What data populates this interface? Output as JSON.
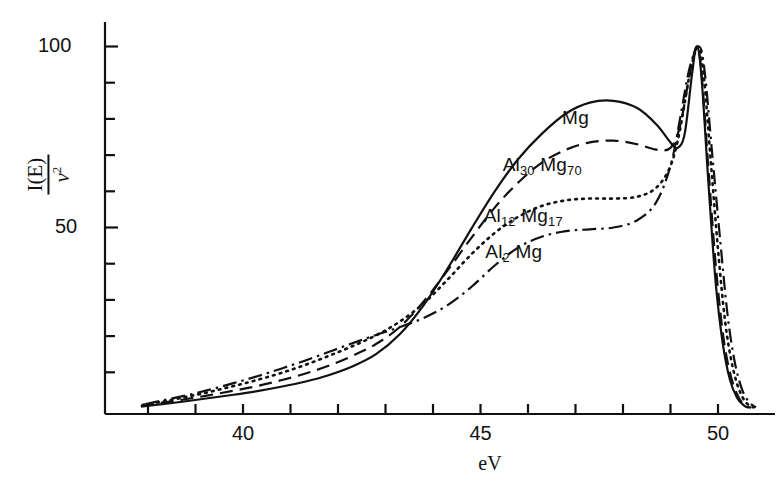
{
  "chart_data": {
    "type": "line",
    "title": "",
    "xlabel": "eV",
    "ylabel": "I(E) / ν²",
    "ylabel_numerator": "I(E)",
    "ylabel_denominator": "ν",
    "ylabel_denominator_exponent": "2",
    "xlim": [
      37.5,
      50.9
    ],
    "ylim": [
      0,
      105
    ],
    "xticks": [
      38,
      39,
      40,
      41,
      42,
      43,
      44,
      45,
      46,
      47,
      48,
      49,
      50
    ],
    "xtick_labels": [
      {
        "value": 40,
        "text": "40"
      },
      {
        "value": 45,
        "text": "45"
      },
      {
        "value": 50,
        "text": "50"
      }
    ],
    "yticks": [
      10,
      20,
      30,
      40,
      50,
      60,
      70,
      80,
      90,
      100
    ],
    "ytick_labels": [
      {
        "value": 50,
        "text": "50"
      },
      {
        "value": 100,
        "text": "100"
      }
    ],
    "grid": false,
    "legend": "inline-annotations",
    "series": [
      {
        "name": "Mg",
        "label": "Mg",
        "linestyle": "solid",
        "label_x": 47.0,
        "label_y": 80.0,
        "points": [
          [
            37.85,
            0.5
          ],
          [
            38.3,
            1.2
          ],
          [
            38.8,
            2.0
          ],
          [
            39.3,
            2.9
          ],
          [
            39.8,
            3.8
          ],
          [
            40.3,
            4.8
          ],
          [
            40.8,
            6.0
          ],
          [
            41.3,
            7.4
          ],
          [
            41.8,
            9.2
          ],
          [
            42.3,
            11.6
          ],
          [
            42.8,
            15.0
          ],
          [
            43.3,
            20.5
          ],
          [
            43.8,
            28.5
          ],
          [
            44.3,
            38.5
          ],
          [
            44.8,
            49.5
          ],
          [
            45.3,
            60.0
          ],
          [
            45.8,
            69.0
          ],
          [
            46.3,
            76.0
          ],
          [
            46.8,
            81.5
          ],
          [
            47.3,
            84.5
          ],
          [
            47.8,
            85.0
          ],
          [
            48.3,
            83.0
          ],
          [
            48.7,
            78.5
          ],
          [
            49.0,
            73.5
          ],
          [
            49.15,
            72.0
          ],
          [
            49.3,
            76.0
          ],
          [
            49.45,
            92.0
          ],
          [
            49.55,
            100.0
          ],
          [
            49.65,
            92.0
          ],
          [
            49.8,
            62.0
          ],
          [
            49.95,
            35.0
          ],
          [
            50.1,
            18.0
          ],
          [
            50.25,
            8.0
          ],
          [
            50.4,
            3.0
          ],
          [
            50.55,
            0.8
          ],
          [
            50.65,
            0.2
          ]
        ]
      },
      {
        "name": "Al30Mg70",
        "label": "Al₃₀ Mg₇₀",
        "label_prefix": "Al",
        "label_sub1": "30",
        "label_mid": " Mg",
        "label_sub2": "70",
        "linestyle": "dashed",
        "label_x": 46.3,
        "label_y": 67.0,
        "points": [
          [
            37.85,
            0.8
          ],
          [
            38.3,
            1.6
          ],
          [
            38.8,
            2.6
          ],
          [
            39.3,
            3.7
          ],
          [
            39.8,
            4.9
          ],
          [
            40.3,
            6.2
          ],
          [
            40.8,
            7.8
          ],
          [
            41.3,
            9.6
          ],
          [
            41.8,
            11.8
          ],
          [
            42.3,
            14.5
          ],
          [
            42.8,
            17.8
          ],
          [
            43.3,
            22.5
          ],
          [
            43.8,
            29.5
          ],
          [
            44.3,
            38.0
          ],
          [
            44.8,
            47.0
          ],
          [
            45.3,
            55.5
          ],
          [
            45.8,
            62.5
          ],
          [
            46.3,
            68.0
          ],
          [
            46.8,
            71.5
          ],
          [
            47.3,
            73.5
          ],
          [
            47.8,
            74.0
          ],
          [
            48.3,
            73.0
          ],
          [
            48.7,
            71.5
          ],
          [
            49.0,
            72.0
          ],
          [
            49.2,
            78.0
          ],
          [
            49.4,
            92.0
          ],
          [
            49.55,
            100.0
          ],
          [
            49.65,
            93.0
          ],
          [
            49.8,
            66.0
          ],
          [
            49.95,
            40.0
          ],
          [
            50.1,
            21.0
          ],
          [
            50.25,
            10.0
          ],
          [
            50.4,
            4.0
          ],
          [
            50.55,
            1.0
          ],
          [
            50.7,
            0.2
          ]
        ]
      },
      {
        "name": "Al12Mg17",
        "label": "Al₁₂ Mg₁₇",
        "label_prefix": "Al",
        "label_sub1": "12",
        "label_mid": " Mg",
        "label_sub2": "17",
        "linestyle": "dotted",
        "label_x": 45.9,
        "label_y": 53.0,
        "points": [
          [
            37.9,
            1.0
          ],
          [
            38.3,
            1.9
          ],
          [
            38.8,
            3.2
          ],
          [
            39.3,
            4.6
          ],
          [
            39.8,
            6.2
          ],
          [
            40.3,
            7.9
          ],
          [
            40.8,
            9.8
          ],
          [
            41.3,
            12.0
          ],
          [
            41.8,
            14.5
          ],
          [
            42.3,
            17.2
          ],
          [
            42.8,
            20.2
          ],
          [
            43.3,
            24.0
          ],
          [
            43.8,
            29.0
          ],
          [
            44.3,
            35.5
          ],
          [
            44.8,
            42.5
          ],
          [
            45.3,
            48.5
          ],
          [
            45.8,
            53.0
          ],
          [
            46.3,
            56.0
          ],
          [
            46.8,
            57.5
          ],
          [
            47.3,
            58.0
          ],
          [
            47.8,
            58.0
          ],
          [
            48.3,
            58.5
          ],
          [
            48.7,
            61.0
          ],
          [
            49.0,
            67.0
          ],
          [
            49.2,
            77.0
          ],
          [
            49.4,
            92.0
          ],
          [
            49.58,
            100.0
          ],
          [
            49.7,
            92.0
          ],
          [
            49.85,
            68.0
          ],
          [
            50.0,
            44.0
          ],
          [
            50.15,
            24.0
          ],
          [
            50.3,
            12.0
          ],
          [
            50.45,
            5.0
          ],
          [
            50.6,
            1.5
          ],
          [
            50.75,
            0.3
          ]
        ]
      },
      {
        "name": "Al2Mg",
        "label": "Al₂ Mg",
        "label_prefix": "Al",
        "label_sub1": "2",
        "label_mid": " Mg",
        "label_sub2": "",
        "linestyle": "dashdot",
        "label_x": 45.7,
        "label_y": 43.0,
        "points": [
          [
            37.95,
            1.2
          ],
          [
            38.3,
            2.2
          ],
          [
            38.8,
            3.6
          ],
          [
            39.3,
            5.2
          ],
          [
            39.8,
            7.0
          ],
          [
            40.3,
            8.9
          ],
          [
            40.8,
            11.0
          ],
          [
            41.3,
            13.2
          ],
          [
            41.8,
            15.6
          ],
          [
            42.3,
            18.0
          ],
          [
            42.8,
            20.3
          ],
          [
            43.3,
            22.5
          ],
          [
            43.8,
            25.0
          ],
          [
            44.3,
            28.5
          ],
          [
            44.8,
            33.5
          ],
          [
            45.3,
            39.5
          ],
          [
            45.8,
            44.5
          ],
          [
            46.3,
            47.5
          ],
          [
            46.8,
            49.0
          ],
          [
            47.3,
            49.5
          ],
          [
            47.8,
            50.0
          ],
          [
            48.3,
            52.0
          ],
          [
            48.7,
            57.0
          ],
          [
            49.0,
            67.0
          ],
          [
            49.2,
            80.0
          ],
          [
            49.4,
            94.0
          ],
          [
            49.6,
            100.0
          ],
          [
            49.72,
            93.0
          ],
          [
            49.88,
            70.0
          ],
          [
            50.05,
            46.0
          ],
          [
            50.2,
            26.0
          ],
          [
            50.35,
            13.0
          ],
          [
            50.5,
            5.5
          ],
          [
            50.65,
            1.8
          ],
          [
            50.8,
            0.3
          ]
        ]
      }
    ]
  },
  "axes": {
    "x_axis_name": "eV",
    "y_axis_name": "I(E)/v2"
  }
}
